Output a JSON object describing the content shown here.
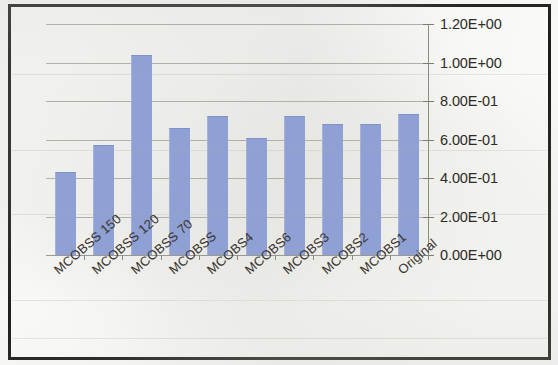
{
  "chart_data": {
    "type": "bar",
    "title": "",
    "subtitle": "",
    "xlabel": "",
    "ylabel": "",
    "categories": [
      "MCOBSS 150",
      "MCOBSS 120",
      "MCOBSS 70",
      "MCOBSS",
      "MCOBS4",
      "MCOBS6",
      "MCOBS3",
      "MCOBS2",
      "MCOBS1",
      "Original"
    ],
    "values": [
      0.43,
      0.57,
      1.04,
      0.66,
      0.72,
      0.61,
      0.72,
      0.68,
      0.68,
      0.73
    ],
    "ylim": [
      0,
      1.2
    ],
    "ytick_values": [
      0,
      0.2,
      0.4,
      0.6,
      0.8,
      1.0,
      1.2
    ],
    "ytick_labels": [
      "0.00E+00",
      "2.00E-01",
      "4.00E-01",
      "6.00E-01",
      "8.00E-01",
      "1.00E+00",
      "1.20E+00"
    ],
    "grid": true,
    "y_axis_position": "right",
    "legend": "none",
    "bar_color": "#8fa0d4",
    "gridline_color": "#a8a49c",
    "frame_color": "#15130f",
    "xtick_label_rotation": -41
  }
}
